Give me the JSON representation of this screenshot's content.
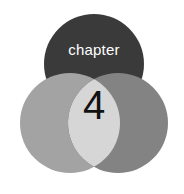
{
  "graphic": {
    "type": "venn-chapter-heading",
    "background_color": "#ffffff",
    "chapter_label": "chapter",
    "chapter_number": "4",
    "label_color": "#ffffff",
    "number_color": "#111111"
  },
  "chart_data": {
    "type": "venn",
    "title": "chapter 4",
    "background": "#ffffff",
    "labels": [
      "chapter",
      "4"
    ],
    "circles": [
      {
        "name": "top-circle",
        "cx": 94,
        "cy": 64,
        "r": 50,
        "color": "#3a3a3a",
        "z": 1,
        "label": "chapter"
      },
      {
        "name": "left-circle",
        "cx": 70,
        "cy": 123,
        "r": 50,
        "color": "#a3a3a3",
        "z": 2,
        "label": ""
      },
      {
        "name": "right-circle",
        "cx": 118,
        "cy": 123,
        "r": 50,
        "color": "#838383",
        "z": 3,
        "label": ""
      }
    ],
    "intersections": [
      {
        "name": "left-right-overlap",
        "members": [
          "left-circle",
          "right-circle"
        ],
        "color": "#d6d6d6",
        "label": "4"
      }
    ],
    "legend": "none",
    "grid": false
  }
}
